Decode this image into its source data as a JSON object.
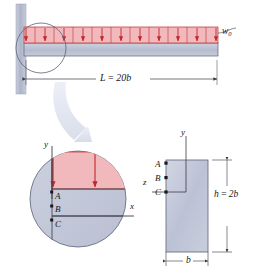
{
  "figure": {
    "colors": {
      "load_fill": "#f2b9bd",
      "load_arrow": "#c0272d",
      "beam_fill": "#b9bed2",
      "wall_fill": "#b4bacb",
      "detail_fill": "#c3c8d8",
      "section_fill": "#c2c7d9",
      "line": "#3a3a46",
      "callout": "#d6dbe8"
    },
    "beam_view": {
      "load_label": "w",
      "load_label_sub": "0",
      "span_label": "L = 20b",
      "span_label_parts": {
        "name": "L",
        "eq": " = ",
        "value": "20b"
      },
      "load_arrow_count": 11,
      "support": "fixed-wall-left"
    },
    "detail_view": {
      "magnified_from": "fixed end of beam",
      "axis_y": "y",
      "axis_x": "x",
      "points": [
        "A",
        "B",
        "C"
      ],
      "load_arrow_count": 2
    },
    "cross_section": {
      "axis_y": "y",
      "axis_z": "z",
      "points": [
        "A",
        "B",
        "C"
      ],
      "height_label": "h = 2b",
      "height_label_parts": {
        "name": "h",
        "eq": " = ",
        "value": "2b"
      },
      "width_label": "b"
    }
  }
}
